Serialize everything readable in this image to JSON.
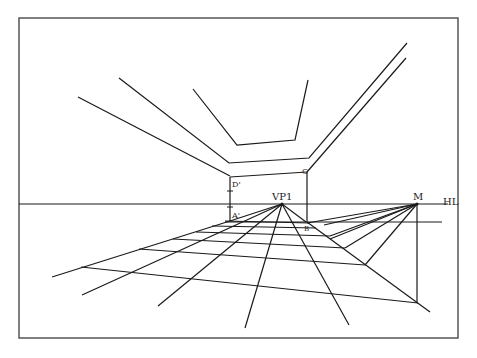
{
  "diagram": {
    "title": "",
    "type": "one-point perspective construction with measuring point",
    "labels": {
      "vp1": "VP1",
      "m": "M",
      "hl": "HL",
      "d_prime": "D'",
      "a_prime": "A'",
      "c": "C",
      "b": "B"
    },
    "colors": {
      "line": "#1a1a1a",
      "frame": "#555555",
      "background": "#ffffff"
    },
    "points": {
      "vp1": [
        282,
        204
      ],
      "m": [
        417,
        204
      ]
    },
    "horizon_y": 204
  }
}
